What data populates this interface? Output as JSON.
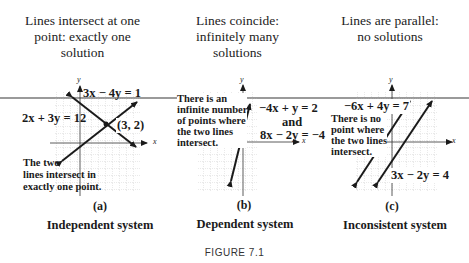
{
  "headings": {
    "a": [
      "Lines intersect at one",
      "point: exactly one",
      "solution"
    ],
    "b": [
      "Lines coincide:",
      "infinitely many",
      "solutions"
    ],
    "c": [
      "Lines are parallel:",
      "no solutions"
    ]
  },
  "panels": {
    "a": {
      "label": "(a)",
      "system": "Independent system",
      "eq1": "3x − 4y = 1",
      "eq2": "2x + 3y = 12",
      "point": "(3, 2)",
      "note": [
        "The two",
        "lines intersect in",
        "exactly one point."
      ],
      "x_axis": "x",
      "y_axis": "y"
    },
    "b": {
      "label": "(b)",
      "system": "Dependent system",
      "eq1": "−4x + y = 2",
      "and": "and",
      "eq2": "8x − 2y = −4",
      "note": [
        "There is an",
        "infinite number",
        "of points where",
        "the two lines",
        "intersect."
      ],
      "x_axis": "x",
      "y_axis": "y"
    },
    "c": {
      "label": "(c)",
      "system": "Inconsistent system",
      "eq1": "−6x + 4y = 7",
      "eq2": "3x − 2y = 4",
      "note": [
        "There is no",
        "point where",
        "the two lines",
        "intersect."
      ],
      "x_axis": "x",
      "y_axis": "y"
    }
  },
  "caption": "FIGURE 7.1",
  "colors": {
    "line": "#1a1a1a",
    "grid": "#b8b8b8",
    "divider": "#9a9a9a"
  }
}
